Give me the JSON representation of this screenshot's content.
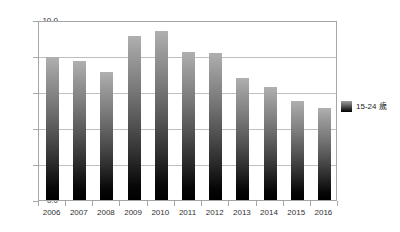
{
  "chart_data": {
    "type": "bar",
    "title": "",
    "subtitle": "",
    "xlabel": "",
    "ylabel": "",
    "categories": [
      "2006",
      "2007",
      "2008",
      "2009",
      "2010",
      "2011",
      "2012",
      "2013",
      "2014",
      "2015",
      "2016"
    ],
    "series": [
      {
        "name": "15-24 歲",
        "values": [
          7.95,
          7.7,
          7.1,
          9.1,
          9.4,
          8.2,
          8.15,
          6.8,
          6.3,
          5.5,
          5.1
        ]
      }
    ],
    "ylim": [
      0.0,
      10.0
    ],
    "ytick_step": 2.0,
    "ytick_labels": [
      "0.0",
      "2.0",
      "4.0",
      "6.0",
      "8.0",
      "10.0"
    ],
    "ytick_values": [
      0.0,
      2.0,
      4.0,
      6.0,
      8.0,
      10.0
    ],
    "grid": true,
    "grid_axis": "y",
    "legend_position": "right",
    "legend_entries": [
      "15-24 歲"
    ],
    "bar_gradient_top_color": "#b0b0b0",
    "bar_gradient_bottom_color": "#000000",
    "gridline_color": "#bfbfbf",
    "frame_color": "#a6a6a6",
    "background_color": "#ffffff",
    "text_color": "#303030"
  }
}
